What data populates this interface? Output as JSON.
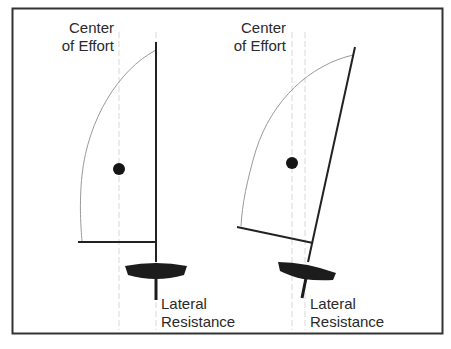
{
  "colors": {
    "frame": "#333333",
    "mast": "#222222",
    "sail_leech": "#9a9a9a",
    "guide_dashed": "#d8d8d8",
    "hull": "#1c1c1c",
    "dot": "#151515",
    "text": "#2a2a2a"
  },
  "panels": [
    {
      "id": "upright",
      "center_of_effort_label": [
        "Center",
        "of Effort"
      ],
      "lateral_resistance_label": [
        "Lateral",
        "Resistance"
      ],
      "description": "Upright rig: center of effort ahead of lateral resistance"
    },
    {
      "id": "raked",
      "center_of_effort_label": [
        "Center",
        "of Effort"
      ],
      "lateral_resistance_label": [
        "Lateral",
        "Resistance"
      ],
      "description": "Raked rig: center of effort moves closer to lateral resistance"
    }
  ]
}
